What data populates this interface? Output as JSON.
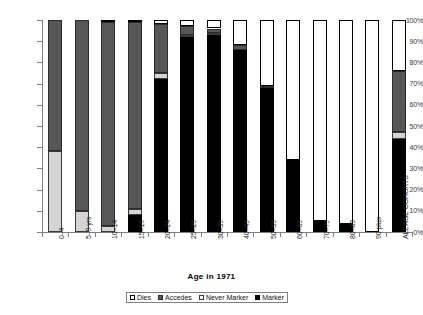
{
  "chart_data": {
    "type": "bar",
    "subtype": "stacked-100-percent",
    "title": "",
    "xlabel": "Age in 1971",
    "ylabel": "",
    "ylim": [
      0,
      100
    ],
    "ytick_labels": [
      "0%",
      "10%",
      "20%",
      "30%",
      "40%",
      "50%",
      "60%",
      "70%",
      "80%",
      "90%",
      "100%"
    ],
    "ytick_values": [
      0,
      10,
      20,
      30,
      40,
      50,
      60,
      70,
      80,
      90,
      100
    ],
    "grid": false,
    "legend_position": "bottom",
    "categories": [
      "0–4",
      "5–9 yrs",
      "10–14",
      "15–19",
      "20–24",
      "25–29",
      "30–39",
      "40–49",
      "50–59",
      "60–69",
      "70–79",
      "80–89",
      "90 plus",
      "ALL AGE COHORTS"
    ],
    "series": [
      {
        "name": "Marker",
        "color": "#000000",
        "values": [
          0,
          0,
          0,
          8,
          72,
          92,
          93,
          86,
          68,
          34,
          5,
          4,
          0,
          44
        ]
      },
      {
        "name": "Never Marker",
        "color": "#d4d4d4",
        "values": [
          38,
          10,
          3,
          3,
          3,
          1,
          1,
          0,
          0,
          0,
          0,
          0,
          0,
          3
        ]
      },
      {
        "name": "Accedes",
        "color": "#575757",
        "values": [
          62,
          90,
          96,
          88,
          23,
          4,
          2,
          2,
          1,
          0,
          0,
          0,
          0,
          29
        ]
      },
      {
        "name": "Dies",
        "color": "#ffffff",
        "values": [
          0,
          0,
          1,
          1,
          2,
          3,
          4,
          12,
          31,
          66,
          95,
          96,
          100,
          24
        ]
      }
    ],
    "legend_entries": [
      "Dies",
      "Accedes",
      "Never Marker",
      "Marker"
    ]
  },
  "legend": {
    "items": [
      {
        "label": "Dies",
        "swatch": "swatch-dies"
      },
      {
        "label": "Accedes",
        "swatch": "swatch-accedes"
      },
      {
        "label": "Never Marker",
        "swatch": "swatch-never-marker"
      },
      {
        "label": "Marker",
        "swatch": "swatch-marker"
      }
    ]
  }
}
